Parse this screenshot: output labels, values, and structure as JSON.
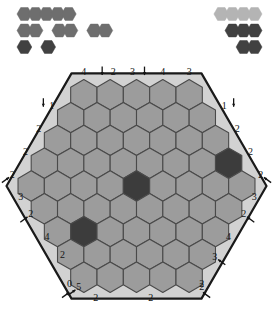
{
  "puzzle": {
    "title": "hex-tile-placement-puzzle",
    "colors": {
      "page_background": "#ffffff",
      "frame_fill": "#d2d2d2",
      "frame_stroke": "#1a1a1a",
      "cell_empty": "#9c9c9c",
      "cell_filled_dark": "#3c3c3c",
      "cell_stroke": "#4a4a4a",
      "tray_medium": "#6e6e6e",
      "tray_light": "#b4b4b4",
      "tray_dark": "#414141",
      "clue_text": "#141414",
      "arrow": "#141414"
    },
    "board": {
      "shape": "hexagon",
      "row_lengths": [
        5,
        6,
        7,
        8,
        9,
        8,
        7,
        6,
        5
      ],
      "total_cells": 61,
      "filled_cells": [
        {
          "row": 3,
          "col": 7,
          "state": "dark"
        },
        {
          "row": 4,
          "col": 4,
          "state": "dark"
        },
        {
          "row": 6,
          "col": 1,
          "state": "dark"
        }
      ]
    },
    "clues": {
      "top": [
        {
          "value": "4",
          "arrow": "none"
        },
        {
          "value": "2",
          "arrow": "down"
        },
        {
          "value": "3",
          "arrow": "down"
        },
        {
          "value": "4",
          "arrow": "none"
        },
        {
          "value": "3",
          "arrow": "none"
        }
      ],
      "top_left": [
        {
          "value": "1",
          "arrow": "down"
        },
        {
          "value": "2",
          "arrow": "none"
        },
        {
          "value": "2",
          "arrow": "none"
        }
      ],
      "top_right": [
        {
          "value": "1",
          "arrow": "down"
        },
        {
          "value": "2",
          "arrow": "none"
        },
        {
          "value": "2",
          "arrow": "none"
        }
      ],
      "left": [
        {
          "value": "2",
          "arrow": "up-right"
        },
        {
          "value": "3",
          "arrow": "none"
        },
        {
          "value": "2",
          "arrow": "up-right"
        },
        {
          "value": "4",
          "arrow": "none"
        },
        {
          "value": "2",
          "arrow": "none"
        },
        {
          "value": "5",
          "arrow": "up-right"
        }
      ],
      "right": [
        {
          "value": "2",
          "arrow": "up-left"
        },
        {
          "value": "3",
          "arrow": "none"
        },
        {
          "value": "2",
          "arrow": "up-left"
        },
        {
          "value": "4",
          "arrow": "none"
        },
        {
          "value": "3",
          "arrow": "up-left"
        },
        {
          "value": "2",
          "arrow": "none"
        }
      ],
      "bottom": [
        {
          "value": "0",
          "arrow": "up-right"
        },
        {
          "value": "2",
          "arrow": "none"
        },
        {
          "value": "2",
          "arrow": "none"
        },
        {
          "value": "2",
          "arrow": "up-left"
        }
      ]
    },
    "tray_left": {
      "label": "left-piece-tray",
      "rows": [
        {
          "groups": [
            5
          ],
          "color": "tray_medium"
        },
        {
          "groups": [
            2,
            2,
            2
          ],
          "color": "tray_medium"
        },
        {
          "groups": [
            1,
            1
          ],
          "color": "tray_dark"
        }
      ]
    },
    "tray_right": {
      "label": "right-piece-tray",
      "rows": [
        {
          "groups": [
            4
          ],
          "color": "tray_light"
        },
        {
          "groups": [
            3
          ],
          "color": "tray_dark"
        },
        {
          "groups": [
            2
          ],
          "color": "tray_dark"
        }
      ]
    }
  }
}
